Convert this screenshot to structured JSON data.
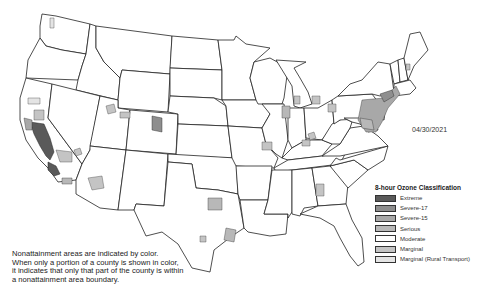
{
  "map": {
    "title": "8-hour Ozone Nonattainment Areas",
    "date": "04/30/2021"
  },
  "legend": {
    "title": "8-hour Ozone Classification",
    "items": [
      {
        "label": "Extreme",
        "color": "#5a5a5a"
      },
      {
        "label": "Severe-17",
        "color": "#8e8e8e"
      },
      {
        "label": "Severe-15",
        "color": "#a8a8a8"
      },
      {
        "label": "Serious",
        "color": "#b8b8b8"
      },
      {
        "label": "Moderate",
        "color": "#ffffff"
      },
      {
        "label": "Marginal",
        "color": "#c4c4c4"
      },
      {
        "label": "Marginal (Rural Transport)",
        "color": "#e4e4e4"
      }
    ]
  },
  "note": {
    "lines": [
      "Nonattainment areas are indicated by color.",
      "When only a portion of a county is shown in color,",
      "it indicates that only that part of the county is within",
      "a nonattainment area boundary."
    ]
  }
}
